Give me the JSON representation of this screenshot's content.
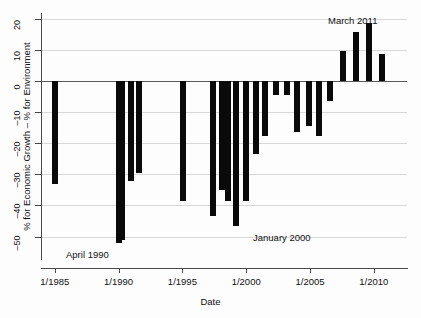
{
  "chart_data": {
    "type": "bar",
    "title": "",
    "xlabel": "Date",
    "ylabel": "% for Economic Growth – % for Environment",
    "ylim": [
      -55,
      22
    ],
    "xlim": [
      1984.0,
      2012.6
    ],
    "grid": true,
    "legend": "none",
    "y_ticks": [
      20,
      10,
      0,
      -10,
      -20,
      -30,
      -40,
      -50
    ],
    "y_ticklabels": [
      "20",
      "10",
      "0",
      "–10",
      "–20",
      "–30",
      "–40",
      "–50"
    ],
    "x_ticks": [
      1985,
      1990,
      1995,
      2000,
      2005,
      2010
    ],
    "x_ticklabels": [
      "1/1985",
      "1/1990",
      "1/1995",
      "1/2000",
      "1/2005",
      "1/2010"
    ],
    "bar_color": "#0a0a0a",
    "categories": [
      "1/1985",
      "1/1990",
      "4/1990",
      "1/1991",
      "1/1992",
      "1/1995",
      "1/1997",
      "1/1998",
      "4/1998",
      "1/1999",
      "1/2000",
      "1/2001",
      "1/2002",
      "1/2003",
      "1/2004",
      "1/2005",
      "1/2006",
      "1/2007",
      "1/2008",
      "1/2009",
      "1/2010",
      "3/2011",
      "1/2012"
    ],
    "x": [
      1985.0,
      1990.0,
      1990.3,
      1991.0,
      1991.6,
      1995.05,
      1997.4,
      1998.1,
      1998.6,
      1999.2,
      2000.0,
      2000.8,
      2001.5,
      2002.3,
      2003.2,
      2004.0,
      2004.9,
      2005.7,
      2006.6,
      2007.6,
      2008.6,
      2009.6,
      2010.6
    ],
    "values": [
      -33.0,
      -52.0,
      -51.0,
      -32.0,
      -29.5,
      -38.5,
      -43.5,
      -35.0,
      -38.5,
      -46.5,
      -38.5,
      -23.5,
      -17.5,
      -4.5,
      -4.5,
      -16.5,
      -14.5,
      -17.5,
      -6.5,
      9.7,
      15.8,
      18.8,
      8.8
    ],
    "annotations": [
      {
        "text": "April 1990",
        "x_px": 66,
        "y_px": 249
      },
      {
        "text": "January 2000",
        "x_px": 253,
        "y_px": 232
      },
      {
        "text": "March 2011",
        "x_px": 328,
        "y_px": 15
      }
    ]
  }
}
